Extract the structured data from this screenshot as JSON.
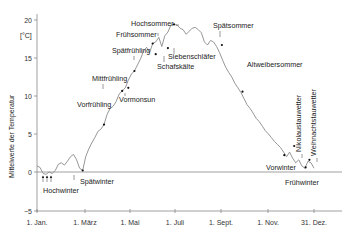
{
  "chart_data": {
    "type": "line",
    "title": "",
    "xlabel": "",
    "ylabel": "Mittelwerte der Temperatur",
    "unit_label": "[°C]",
    "ylim": [
      -5,
      20
    ],
    "yticks": [
      20,
      15,
      10,
      5,
      0,
      -5
    ],
    "xticks": [
      {
        "label": "1. Jan.",
        "day": 0
      },
      {
        "label": "1. März",
        "day": 59
      },
      {
        "label": "1. Mai",
        "day": 120
      },
      {
        "label": "1. Juli",
        "day": 181
      },
      {
        "label": "1. Sept.",
        "day": 243
      },
      {
        "label": "1. Nov.",
        "day": 304
      },
      {
        "label": "31. Dez.",
        "day": 364
      }
    ],
    "grid": false,
    "series": [
      {
        "name": "Mittelwerte der Temperatur",
        "x": [
          0,
          4,
          8,
          12,
          16,
          20,
          24,
          28,
          32,
          36,
          40,
          44,
          48,
          52,
          56,
          60,
          64,
          68,
          72,
          76,
          80,
          84,
          88,
          92,
          96,
          100,
          104,
          108,
          112,
          116,
          120,
          124,
          128,
          132,
          136,
          140,
          144,
          148,
          152,
          156,
          160,
          164,
          168,
          172,
          176,
          180,
          184,
          188,
          192,
          196,
          200,
          204,
          208,
          212,
          216,
          220,
          224,
          228,
          232,
          236,
          240,
          244,
          248,
          252,
          256,
          260,
          264,
          268,
          272,
          276,
          280,
          284,
          288,
          292,
          296,
          300,
          304,
          308,
          312,
          316,
          320,
          324,
          328,
          332,
          336,
          340,
          344,
          348,
          352,
          356,
          360,
          364
        ],
        "values": [
          0.8,
          0.6,
          -0.2,
          -0.3,
          0.0,
          -0.2,
          0.2,
          1.0,
          1.2,
          0.9,
          1.4,
          2.0,
          2.3,
          1.6,
          0.5,
          0.2,
          2.0,
          3.0,
          3.8,
          4.5,
          5.3,
          5.6,
          6.2,
          7.5,
          8.3,
          8.6,
          9.2,
          10.2,
          10.6,
          11.0,
          12.0,
          12.8,
          13.2,
          14.0,
          14.8,
          15.8,
          16.3,
          15.6,
          16.8,
          17.0,
          17.6,
          16.4,
          17.8,
          18.3,
          19.2,
          19.3,
          19.2,
          18.8,
          18.6,
          18.0,
          18.4,
          18.8,
          18.9,
          18.6,
          18.2,
          17.0,
          16.6,
          17.2,
          17.0,
          16.4,
          15.6,
          14.6,
          13.7,
          13.0,
          12.4,
          11.6,
          11.0,
          10.4,
          9.6,
          8.8,
          8.3,
          7.7,
          7.0,
          6.6,
          6.0,
          5.4,
          5.0,
          4.5,
          4.0,
          3.6,
          3.2,
          2.6,
          2.0,
          2.6,
          1.8,
          1.2,
          1.6,
          0.8,
          0.5,
          1.4,
          1.2,
          0.5
        ]
      }
    ],
    "annotations": [
      {
        "label": "Hochwinter",
        "day": 8,
        "temp": -0.2,
        "marker": "arrow",
        "count": 3
      },
      {
        "label": "Spätwinter",
        "day": 60,
        "temp": 0.2
      },
      {
        "label": "Vorfrühling",
        "day": 88,
        "temp": 6.2
      },
      {
        "label": "Mittfrühling",
        "day": 112,
        "temp": 10.6
      },
      {
        "label": "Vormonsun",
        "day": 120,
        "temp": 11.0
      },
      {
        "label": "Spätfrühling",
        "day": 128,
        "temp": 13.2
      },
      {
        "label": "Frühsommer",
        "day": 152,
        "temp": 16.8
      },
      {
        "label": "Schafskälte",
        "day": 156,
        "temp": 15.4
      },
      {
        "label": "Siebenschläfer",
        "day": 172,
        "temp": 16.2
      },
      {
        "label": "Hochsommer",
        "day": 180,
        "temp": 19.3
      },
      {
        "label": "Spätsommer",
        "day": 243,
        "temp": 16.6
      },
      {
        "label": "Altweibersommer",
        "day": 270,
        "temp": 10.5
      },
      {
        "label": "Vorwinter",
        "day": 325,
        "temp": 2.2
      },
      {
        "label": "Nikolaustauwetter",
        "day": 338,
        "temp": 3.4
      },
      {
        "label": "Frühwinter",
        "day": 353,
        "temp": 0.6
      },
      {
        "label": "Weihnachtstauwetter",
        "day": 358,
        "temp": 1.6
      }
    ]
  },
  "axes": {
    "y_title": "Mittelwerte der Temperatur",
    "y_unit": "[°C]",
    "y_tick_labels": [
      "20",
      "15",
      "10",
      "5",
      "0",
      "−5"
    ],
    "x_tick_labels": [
      "1. Jan.",
      "1. März",
      "1. Mai",
      "1. Juli",
      "1. Sept.",
      "1. Nov.",
      "31. Dez."
    ]
  },
  "labels": {
    "hochwinter": "Hochwinter",
    "spaetwinter": "Spätwinter",
    "vorfruehling": "Vorfrühling",
    "mittfruehling": "Mittfrühling",
    "vormonsun": "Vormonsun",
    "spaetfruehling": "Spätfrühling",
    "fruehsommer": "Frühsommer",
    "hochsommer": "Hochsommer",
    "schafskaelte": "Schafskälte",
    "siebenschlaefer": "Siebenschläfer",
    "spaetsommer": "Spätsommer",
    "altweibersommer": "Altweibersommer",
    "nikolaustauwetter": "Nikolaustauwetter",
    "weihnachtstauwetter": "Weihnachtstauwetter",
    "vorwinter": "Vorwinter",
    "fruehwinter": "Frühwinter"
  },
  "colors": {
    "line": "#8a8a8a",
    "axis": "#777777",
    "text": "#222222",
    "marker": "#111111"
  }
}
